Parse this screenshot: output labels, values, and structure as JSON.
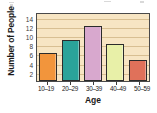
{
  "chart_data": {
    "type": "bar",
    "title": "",
    "xlabel": "Age",
    "ylabel": "Number of People",
    "categories": [
      "10–19",
      "20–29",
      "30–39",
      "40–49",
      "50–59"
    ],
    "values": [
      6,
      9,
      12,
      8,
      4.5
    ],
    "ylim": [
      0,
      15
    ],
    "yticks": [
      2,
      4,
      6,
      8,
      10,
      12,
      14
    ],
    "ytick_labels": [
      "2",
      "4",
      "6",
      "8",
      "10",
      "12",
      "14"
    ],
    "grid": true,
    "legend": "none",
    "bar_colors": [
      "#f2953c",
      "#2aa39a",
      "#d8a8ce",
      "#e8f0a8",
      "#e0715a"
    ],
    "plot_background": "#f7e5c3",
    "gridline_color": "#d8bf92",
    "axis_color": "#4a4a4a"
  },
  "artifacts": {
    "label": "scan-artifacts"
  }
}
